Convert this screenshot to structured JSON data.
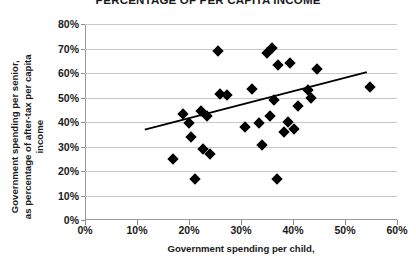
{
  "chart_data": {
    "type": "scatter",
    "title": "PERCENTAGE OF PER CAPITA INCOME",
    "xlabel": "Government spending per child,",
    "ylabel_line1": "Government spending per senior,",
    "ylabel_line2": "as percentage of after-tax per capita income",
    "xlim": [
      0,
      60
    ],
    "ylim": [
      0,
      80
    ],
    "xtick_labels": [
      "0%",
      "10%",
      "20%",
      "30%",
      "40%",
      "50%",
      "60%"
    ],
    "xtick_values": [
      0,
      10,
      20,
      30,
      40,
      50,
      60
    ],
    "ytick_labels": [
      "0%",
      "10%",
      "20%",
      "30%",
      "40%",
      "50%",
      "60%",
      "70%",
      "80%"
    ],
    "ytick_values": [
      0,
      10,
      20,
      30,
      40,
      50,
      60,
      70,
      80
    ],
    "grid": "horizontal",
    "legend": "none",
    "marker_color": "#000000",
    "marker_shape": "diamond",
    "trendline_color": "#000000",
    "points": [
      {
        "x": 17.0,
        "y": 24.8
      },
      {
        "x": 18.9,
        "y": 43.4
      },
      {
        "x": 20.0,
        "y": 39.6
      },
      {
        "x": 20.4,
        "y": 34.0
      },
      {
        "x": 21.2,
        "y": 16.8
      },
      {
        "x": 22.3,
        "y": 44.3
      },
      {
        "x": 22.7,
        "y": 29.0
      },
      {
        "x": 23.5,
        "y": 42.6
      },
      {
        "x": 24.0,
        "y": 27.0
      },
      {
        "x": 25.6,
        "y": 68.9
      },
      {
        "x": 26.0,
        "y": 51.3
      },
      {
        "x": 27.3,
        "y": 51.0
      },
      {
        "x": 30.8,
        "y": 37.8
      },
      {
        "x": 32.2,
        "y": 53.6
      },
      {
        "x": 33.5,
        "y": 39.5
      },
      {
        "x": 34.0,
        "y": 30.8
      },
      {
        "x": 35.0,
        "y": 68.2
      },
      {
        "x": 35.5,
        "y": 42.3
      },
      {
        "x": 36.0,
        "y": 70.3
      },
      {
        "x": 36.4,
        "y": 48.8
      },
      {
        "x": 37.0,
        "y": 16.8
      },
      {
        "x": 37.2,
        "y": 63.2
      },
      {
        "x": 38.3,
        "y": 35.8
      },
      {
        "x": 39.0,
        "y": 39.8
      },
      {
        "x": 39.5,
        "y": 63.9
      },
      {
        "x": 40.2,
        "y": 37.3
      },
      {
        "x": 41.0,
        "y": 46.4
      },
      {
        "x": 42.8,
        "y": 52.9
      },
      {
        "x": 43.5,
        "y": 49.7
      },
      {
        "x": 44.6,
        "y": 61.6
      },
      {
        "x": 54.8,
        "y": 54.1
      }
    ],
    "trendline": {
      "x_start": 11.5,
      "y_start": 36.9,
      "x_end": 54.2,
      "y_end": 60.4
    }
  }
}
